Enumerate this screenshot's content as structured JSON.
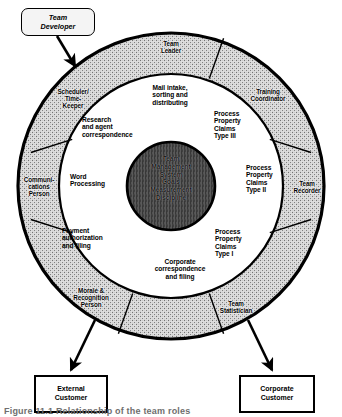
{
  "diagram": {
    "hub": {
      "lines": "Team\nManagement\nSystem\nGoals\nMeasurement\nDiscipline",
      "fill_color": "#4a4a4a"
    },
    "outer_ring": {
      "fill_color": "#d8d8d8",
      "segments": [
        {
          "id": "team-leader",
          "label": "Team\nLeader"
        },
        {
          "id": "training-coordinator",
          "label": "Training\nCoordinator"
        },
        {
          "id": "team-recorder",
          "label": "Team\nRecorder"
        },
        {
          "id": "team-statistician",
          "label": "Team\nStatistician"
        },
        {
          "id": "morale-recognition-person",
          "label": "Morale &\nRecognition\nPerson"
        },
        {
          "id": "communications-person",
          "label": "Communi-\ncations\nPerson"
        },
        {
          "id": "scheduler-timekeeper",
          "label": "Scheduler/\nTime-\nKeeper"
        }
      ]
    },
    "inner_ring": {
      "fill_color": "#ffffff",
      "functions": [
        {
          "id": "mail-intake",
          "label": "Mail intake,\nsorting and\ndistributing"
        },
        {
          "id": "process-claims-type-3",
          "label": "Process\nProperty\nClaims\nType III"
        },
        {
          "id": "process-claims-type-2",
          "label": "Process\nProperty\nClaims\nType II"
        },
        {
          "id": "process-claims-type-1",
          "label": "Process\nProperty\nClaims\nType I"
        },
        {
          "id": "corporate-correspondence",
          "label": "Corporate\ncorrespondence\nand filing"
        },
        {
          "id": "payment-authorization",
          "label": "Payment\nauthorization\nand filing"
        },
        {
          "id": "word-processing",
          "label": "Word\nProcessing"
        },
        {
          "id": "research-agent-correspondence",
          "label": "Research\nand agent\ncorrespondence"
        }
      ]
    },
    "callouts": [
      {
        "id": "team-developer",
        "label": "Team\nDeveloper"
      },
      {
        "id": "external-customer",
        "label": "External\nCustomer"
      },
      {
        "id": "corporate-customer",
        "label": "Corporate\nCustomer"
      }
    ],
    "caption": "Figure 11.1  Relationship of the team roles"
  }
}
